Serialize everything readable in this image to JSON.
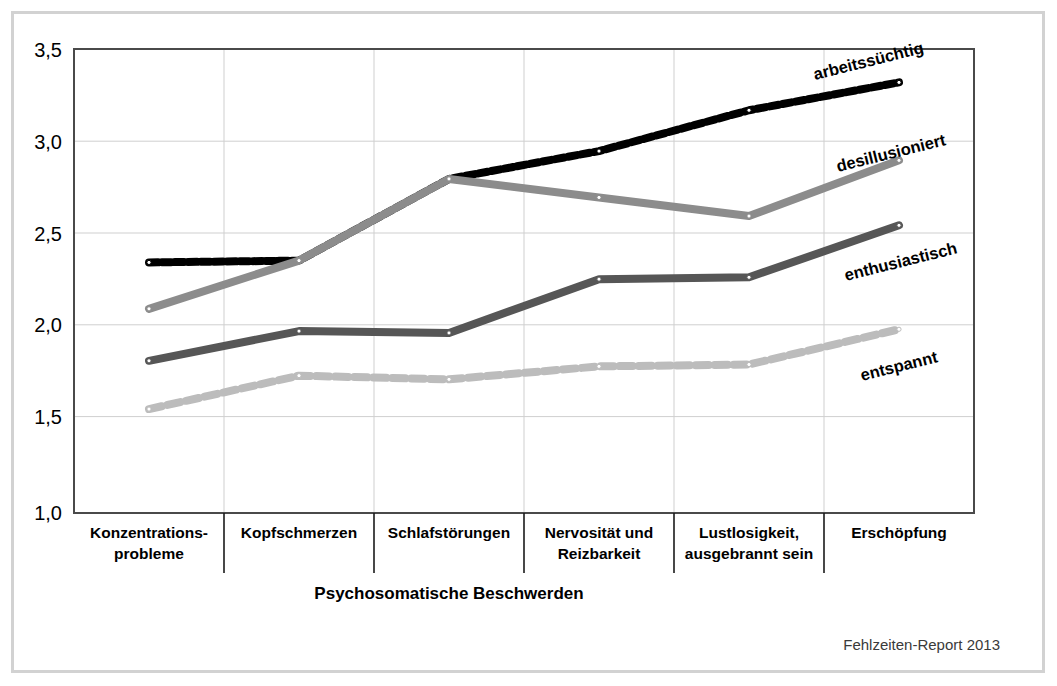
{
  "figure": {
    "source_note": "Fehlzeiten-Report 2013"
  },
  "chart_data": {
    "type": "line",
    "title": "",
    "subtitle": "",
    "xlabel": "Psychosomatische Beschwerden",
    "ylabel": "",
    "ylim": [
      1.0,
      3.5
    ],
    "yticks": [
      1.0,
      1.5,
      2.0,
      2.5,
      3.0,
      3.5
    ],
    "ytick_labels": [
      "1,0",
      "1,5",
      "2,0",
      "2,5",
      "3,0",
      "3,5"
    ],
    "grid": true,
    "legend_position": "inline-right",
    "categories": [
      "Konzentrations-\nprobleme",
      "Kopfschmerzen",
      "Schlafstörungen",
      "Nervosität und\nReizbarkeit",
      "Lustlosigkeit,\nausgebrannt sein",
      "Erschöpfung"
    ],
    "category_labels_line1": [
      "Konzentrations-",
      "Kopfschmerzen",
      "Schlafstörungen",
      "Nervosität und",
      "Lustlosigkeit,",
      "Erschöpfung"
    ],
    "category_labels_line2": [
      "probleme",
      "",
      "",
      "Reizbarkeit",
      "ausgebrannt sein",
      ""
    ],
    "series": [
      {
        "name": "arbeitssüchtig",
        "color": "#000000",
        "style": "dotted-thick",
        "values": [
          2.35,
          2.36,
          2.8,
          2.95,
          3.17,
          3.32
        ]
      },
      {
        "name": "desillusioniert",
        "color": "#8c8c8c",
        "style": "solid-thick",
        "values": [
          2.1,
          2.36,
          2.8,
          2.7,
          2.6,
          2.9
        ]
      },
      {
        "name": "enthusiastisch",
        "color": "#565656",
        "style": "solid-thick",
        "values": [
          1.82,
          1.98,
          1.97,
          2.26,
          2.27,
          2.55
        ]
      },
      {
        "name": "entspannt",
        "color": "#bcbcbc",
        "style": "dashed-thick",
        "values": [
          1.56,
          1.74,
          1.72,
          1.79,
          1.8,
          1.99
        ]
      }
    ]
  }
}
